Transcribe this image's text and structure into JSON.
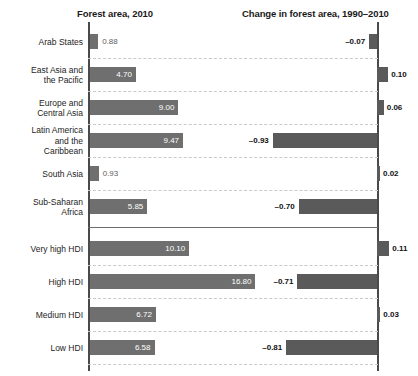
{
  "panels": {
    "left_title": "Forest area, 2010",
    "right_title": "Change in forest area, 1990–2010"
  },
  "chart_data": {
    "type": "bar",
    "xlabel": "",
    "ylabel": "",
    "grid": true,
    "legend": "none",
    "orientation": "horizontal",
    "panel_layout": "two-panel back-to-back (left grows rightward, right grows from right axis)",
    "categories": [
      "Arab States",
      "East Asia and\nthe Pacific",
      "Europe and\nCentral Asia",
      "Latin America\nand the\nCaribbean",
      "South Asia",
      "Sub-Saharan\nAfrica",
      "Very high HDI",
      "High HDI",
      "Medium HDI",
      "Low HDI"
    ],
    "group_break_after_index": 5,
    "series": [
      {
        "name": "Forest area, 2010",
        "panel": "left",
        "values": [
          0.88,
          4.7,
          9.0,
          9.47,
          0.93,
          5.85,
          10.1,
          16.8,
          6.72,
          6.58
        ],
        "labels": [
          "0.88",
          "4.70",
          "9.00",
          "9.47",
          "0.93",
          "5.85",
          "10.10",
          "16.80",
          "6.72",
          "6.58"
        ],
        "xlim": [
          0,
          29
        ],
        "color": "#6f6f6f"
      },
      {
        "name": "Change in forest area, 1990–2010",
        "panel": "right",
        "values": [
          -0.07,
          0.1,
          0.06,
          -0.93,
          0.02,
          -0.7,
          0.11,
          -0.71,
          0.03,
          -0.81
        ],
        "labels": [
          "–0.07",
          "0.10",
          "0.06",
          "–0.93",
          "0.02",
          "–0.70",
          "0.11",
          "–0.71",
          "0.03",
          "–0.81"
        ],
        "xlim": [
          -1.0,
          0.35
        ],
        "color": "#5a5a5a"
      }
    ]
  },
  "rows": [
    {
      "label": "Arab States",
      "left_value": "0.88",
      "right_value": "–0.07"
    },
    {
      "label": "East Asia and\nthe Pacific",
      "left_value": "4.70",
      "right_value": "0.10"
    },
    {
      "label": "Europe and\nCentral Asia",
      "left_value": "9.00",
      "right_value": "0.06"
    },
    {
      "label": "Latin America\nand the\nCaribbean",
      "left_value": "9.47",
      "right_value": "–0.93"
    },
    {
      "label": "South Asia",
      "left_value": "0.93",
      "right_value": "0.02"
    },
    {
      "label": "Sub-Saharan\nAfrica",
      "left_value": "5.85",
      "right_value": "–0.70"
    },
    {
      "label": "Very high HDI",
      "left_value": "10.10",
      "right_value": "0.11"
    },
    {
      "label": "High HDI",
      "left_value": "16.80",
      "right_value": "–0.71"
    },
    {
      "label": "Medium HDI",
      "left_value": "6.72",
      "right_value": "0.03"
    },
    {
      "label": "Low HDI",
      "left_value": "6.58",
      "right_value": "–0.81"
    }
  ],
  "colors": {
    "left_bar": "#6f6f6f",
    "right_bar": "#5a5a5a",
    "axis": "#4a4a4a",
    "gridline": "#c9c9c9",
    "text": "#1a1a1a"
  }
}
